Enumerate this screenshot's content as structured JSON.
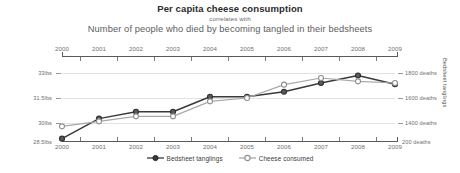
{
  "titles": {
    "main": "Per capita cheese consumption",
    "middle": "correlates with",
    "sub": "Number of people who died by becoming tangled in their bedsheets"
  },
  "axes": {
    "left_title": "Cheese consumed",
    "right_title": "Bedsheet tanglings",
    "left_ticks": [
      "33lbs",
      "31.5lbs",
      "30lbs",
      "28.5lbs"
    ],
    "right_ticks": [
      "1800 deaths",
      "1600 deaths",
      "1400 deaths",
      "200 deaths"
    ],
    "years": [
      "2000",
      "2001",
      "2002",
      "2003",
      "2004",
      "2005",
      "2006",
      "2007",
      "2008",
      "2009"
    ]
  },
  "legend": {
    "items": [
      {
        "label": "Bedsheet tanglings",
        "color": "#3a3a3a",
        "marker": "filled-circle-marker"
      },
      {
        "label": "Cheese consumed",
        "color": "#a8a8a8",
        "marker": "open-circle-marker"
      }
    ]
  },
  "chart_data": {
    "type": "line",
    "title": "Per capita cheese consumption correlates with Number of people who died by becoming tangled in their bedsheets",
    "subtitle": "correlates with",
    "xlabel": "",
    "ylabel": "Cheese consumed",
    "y2label": "Bedsheet tanglings",
    "grid": true,
    "legend_position": "bottom",
    "x": [
      2000,
      2001,
      2002,
      2003,
      2004,
      2005,
      2006,
      2007,
      2008,
      2009
    ],
    "xlim": [
      2000,
      2009
    ],
    "ylim": [
      28.5,
      33.0
    ],
    "y2lim": [
      1200,
      1800
    ],
    "ytick_values": [
      33.0,
      31.5,
      30.0,
      28.5
    ],
    "ytick_labels": [
      "33lbs",
      "31.5lbs",
      "30lbs",
      "28.5lbs"
    ],
    "y2tick_values": [
      1800,
      1600,
      1400,
      1200
    ],
    "y2tick_labels": [
      "1800 deaths",
      "1600 deaths",
      "1400 deaths",
      "200 deaths"
    ],
    "series": [
      {
        "name": "Bedsheet tanglings",
        "axis": "right",
        "color": "#3a3a3a",
        "units": "deaths",
        "values": [
          1275,
          1435,
          1490,
          1490,
          1610,
          1610,
          1650,
          1720,
          1780,
          1710
        ]
      },
      {
        "name": "Cheese consumed",
        "axis": "left",
        "color": "#a8a8a8",
        "units": "lbs",
        "values": [
          29.8,
          30.1,
          30.4,
          30.4,
          31.3,
          31.5,
          32.3,
          32.7,
          32.5,
          32.4
        ]
      }
    ]
  }
}
